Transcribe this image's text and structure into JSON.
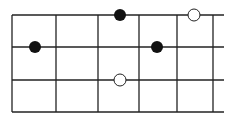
{
  "diagram": {
    "type": "fretboard",
    "colors": {
      "line": "#222222",
      "filled": "#111111",
      "open_fill": "#ffffff"
    },
    "strings_y": [
      15,
      47,
      80,
      112
    ],
    "frets_x": [
      12,
      56,
      98,
      139,
      177,
      213
    ],
    "string_end_x": 224,
    "dot_radius": 6,
    "dots": [
      {
        "x": 35,
        "y": 47,
        "style": "filled"
      },
      {
        "x": 120,
        "y": 15,
        "style": "filled"
      },
      {
        "x": 157,
        "y": 47,
        "style": "filled"
      },
      {
        "x": 194,
        "y": 15,
        "style": "open"
      },
      {
        "x": 120,
        "y": 80,
        "style": "open"
      }
    ]
  }
}
